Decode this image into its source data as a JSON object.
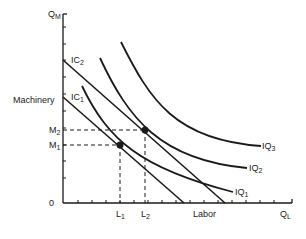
{
  "diagram": {
    "axes": {
      "y_axis_label": "Q",
      "y_axis_sub": "M",
      "x_axis_label": "Q",
      "x_axis_sub": "L",
      "y_title": "Machinery",
      "x_title": "Labor",
      "origin": "0"
    },
    "isocost_lines": [
      {
        "label": "IC",
        "sub": "2"
      },
      {
        "label": "IC",
        "sub": "1"
      }
    ],
    "isoquants": [
      {
        "label": "IQ",
        "sub": "3"
      },
      {
        "label": "IQ",
        "sub": "2"
      },
      {
        "label": "IQ",
        "sub": "1"
      }
    ],
    "y_marks": [
      {
        "label": "M",
        "sub": "2"
      },
      {
        "label": "M",
        "sub": "1"
      }
    ],
    "x_marks": [
      {
        "label": "L",
        "sub": "1"
      },
      {
        "label": "L",
        "sub": "2"
      }
    ],
    "colors": {
      "line": "#1a1a1a",
      "text": "#222222"
    }
  }
}
